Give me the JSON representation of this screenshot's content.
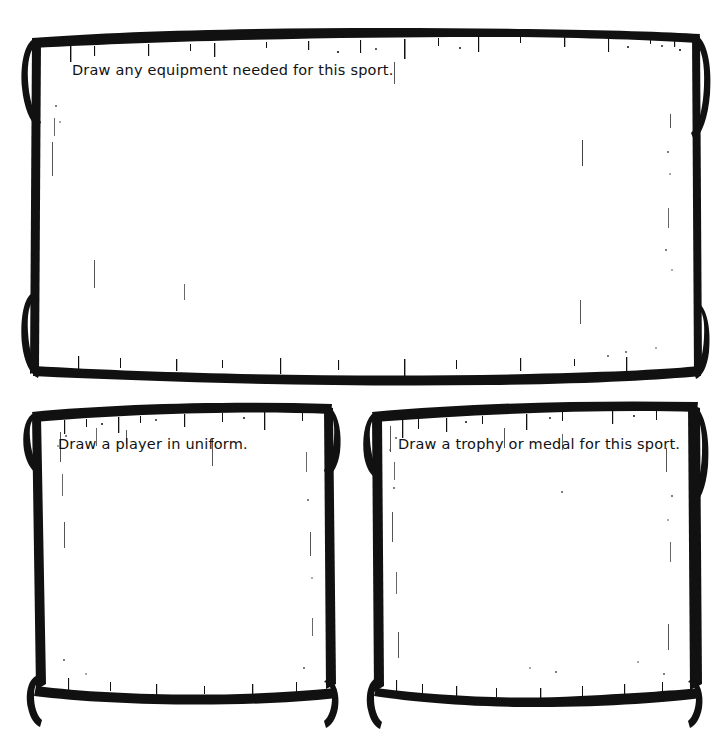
{
  "document": {
    "title": "Sport Drawing Worksheet",
    "background_color": "#ffffff",
    "ink_color": "#111111",
    "style": "hand-drawn ink scroll banner"
  },
  "panels": [
    {
      "id": "equipment",
      "prompt": "Draw any equipment needed for this sport.",
      "drawing_area_label": "equipment drawing area",
      "content": ""
    },
    {
      "id": "player",
      "prompt": "Draw a player in uniform.",
      "drawing_area_label": "player drawing area",
      "content": ""
    },
    {
      "id": "trophy",
      "prompt": "Draw a trophy or medal for this sport.",
      "drawing_area_label": "trophy drawing area",
      "content": ""
    }
  ]
}
